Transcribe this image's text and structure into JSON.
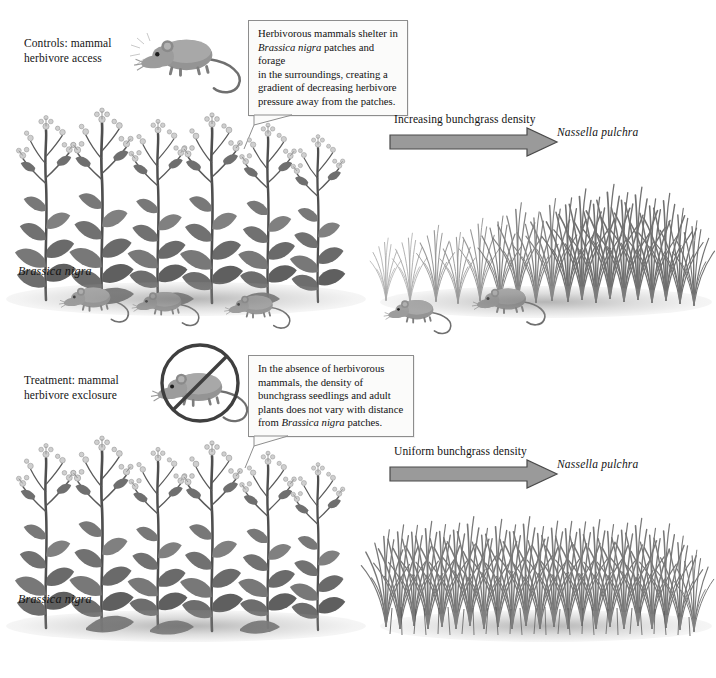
{
  "figure": {
    "background_color": "#ffffff",
    "ink_color": "#141414",
    "arrow_fill": "#9a9a9a",
    "arrow_stroke": "#4a4a4a",
    "callout_fill": "#fbfbfa",
    "callout_border": "#8d8d8d"
  },
  "panels": {
    "control": {
      "treatment_label": "Controls: mammal\nherbivore access",
      "treatment_label_line1": "Controls: mammal",
      "treatment_label_line2": "herbivore access",
      "icon_name": "mouse-icon",
      "callout": {
        "line1": "Herbivorous mammals shelter in",
        "line2_italic": "Brassica nigra",
        "line2_rest": " patches and forage",
        "line3": "in the surroundings, creating a",
        "line4": "gradient of decreasing herbivore",
        "line5": "pressure away from the patches."
      },
      "left_plant_label": "Brassica nigra",
      "arrow_label": "Increasing bunchgrass density",
      "grass_label": "Nassella pulchra",
      "mouse_count_in_brassica": 3,
      "mouse_count_in_grass": 2,
      "grass_pattern": "gradient-increasing-left-to-right"
    },
    "exclosure": {
      "treatment_label_line1": "Treatment: mammal",
      "treatment_label_line2": "herbivore exclosure",
      "icon_name": "no-mouse-icon",
      "callout": {
        "line1": "In the absence of herbivorous",
        "line2": "mammals, the density of",
        "line3": "bunchgrass seedlings and adult",
        "line4": "plants does not vary with distance",
        "line5_pre": "from ",
        "line5_italic": "Brassica nigra",
        "line5_rest": " patches."
      },
      "left_plant_label": "Brassica nigra",
      "arrow_label": "Uniform bunchgrass density",
      "grass_label": "Nassella pulchra",
      "mouse_count_in_brassica": 0,
      "mouse_count_in_grass": 0,
      "grass_pattern": "uniform-dense"
    }
  }
}
